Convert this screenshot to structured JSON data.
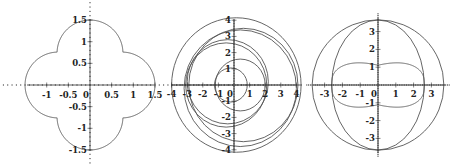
{
  "chart_data": [
    {
      "type": "line",
      "title": "",
      "description": "Four-lobed polar curve (quatrefoil)",
      "xlim": [
        -1.5,
        1.5
      ],
      "ylim": [
        -1.5,
        1.5
      ],
      "xticks": [
        "-1",
        "-0.5",
        "0",
        "0.5",
        "1",
        "1.5"
      ],
      "yticks": [
        "1.5",
        "1",
        "0.5",
        "-0.5",
        "-1",
        "-1.5"
      ],
      "curve": {
        "lobes": 4,
        "r_max": 1.5,
        "r_min": 1.0
      }
    },
    {
      "type": "line",
      "title": "",
      "description": "Family of overlapping circles",
      "xlim": [
        -4,
        4
      ],
      "ylim": [
        -4,
        4
      ],
      "xticks": [
        "-4",
        "-3",
        "-2",
        "-1",
        "0",
        "1",
        "2",
        "3",
        "4"
      ],
      "yticks": [
        "4",
        "3",
        "2",
        "1",
        "-1",
        "-2",
        "-3",
        "-4"
      ],
      "circles": [
        {
          "cx": 0.15,
          "cy": 0,
          "r": 4.15
        },
        {
          "cx": 0.6,
          "cy": 0,
          "r": 3.5
        },
        {
          "cx": -0.5,
          "cy": 0,
          "r": 2.6
        },
        {
          "cx": 0.4,
          "cy": 0,
          "r": 1.6
        },
        {
          "cx": -0.2,
          "cy": 0,
          "r": 1.05
        }
      ]
    },
    {
      "type": "line",
      "title": "",
      "description": "Circle, ellipse and peanut-shaped curve",
      "xlim": [
        -3.7,
        3.7
      ],
      "ylim": [
        -3.7,
        3.7
      ],
      "xticks": [
        "-3",
        "-2",
        "-1",
        "0",
        "1",
        "2",
        "3"
      ],
      "yticks": [
        "3",
        "2",
        "1",
        "-1",
        "-2",
        "-3"
      ],
      "curves": [
        {
          "name": "circle",
          "rx": 3.7,
          "ry": 3.7
        },
        {
          "name": "ellipse",
          "rx": 2.6,
          "ry": 3.65
        },
        {
          "name": "peanut",
          "x_extent": 2.6,
          "y_peak": 1.4,
          "y_center": 1.2
        }
      ]
    }
  ]
}
